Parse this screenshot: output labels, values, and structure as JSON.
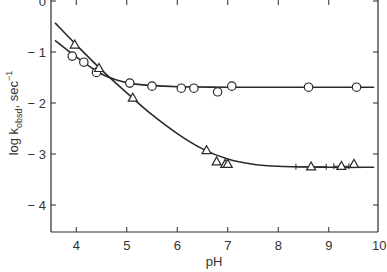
{
  "chart_data": {
    "type": "scatter",
    "title": "",
    "xlabel": "pH",
    "ylabel": "log k_obsd, sec^-1",
    "ylabel_parts": {
      "main": "log k",
      "sub": "obsd",
      "unit": ", sec",
      "sup": "−1"
    },
    "xlim": [
      3.5,
      10
    ],
    "ylim": [
      -4.55,
      0
    ],
    "x_ticks": [
      4,
      5,
      6,
      7,
      8,
      9,
      10
    ],
    "x_tick_labels": [
      "4",
      "5",
      "6",
      "7",
      "8",
      "9",
      "10"
    ],
    "y_ticks": [
      0,
      -1,
      -2,
      -3,
      -4
    ],
    "y_tick_labels": [
      "0",
      "− 1",
      "− 2",
      "− 3",
      "− 4"
    ],
    "grid": false,
    "legend": null,
    "series": [
      {
        "name": "circles",
        "marker": "circle",
        "points": [
          {
            "x": 3.92,
            "y": -1.08
          },
          {
            "x": 4.15,
            "y": -1.2
          },
          {
            "x": 4.4,
            "y": -1.4
          },
          {
            "x": 5.06,
            "y": -1.61
          },
          {
            "x": 5.5,
            "y": -1.67
          },
          {
            "x": 6.08,
            "y": -1.71
          },
          {
            "x": 6.33,
            "y": -1.71
          },
          {
            "x": 6.8,
            "y": -1.78
          },
          {
            "x": 7.08,
            "y": -1.67
          },
          {
            "x": 8.6,
            "y": -1.69
          },
          {
            "x": 9.55,
            "y": -1.69
          }
        ],
        "fit_curve": [
          [
            3.58,
            -0.77
          ],
          [
            3.9,
            -1.02
          ],
          [
            4.2,
            -1.24
          ],
          [
            4.5,
            -1.43
          ],
          [
            4.8,
            -1.55
          ],
          [
            5.1,
            -1.62
          ],
          [
            5.5,
            -1.66
          ],
          [
            6.0,
            -1.68
          ],
          [
            7.0,
            -1.69
          ],
          [
            8.0,
            -1.69
          ],
          [
            9.0,
            -1.69
          ],
          [
            9.9,
            -1.69
          ]
        ]
      },
      {
        "name": "triangles",
        "marker": "triangle",
        "points": [
          {
            "x": 3.97,
            "y": -0.86
          },
          {
            "x": 4.45,
            "y": -1.32
          },
          {
            "x": 5.12,
            "y": -1.9
          },
          {
            "x": 6.58,
            "y": -2.93
          },
          {
            "x": 6.78,
            "y": -3.15
          },
          {
            "x": 6.95,
            "y": -3.2
          },
          {
            "x": 7.0,
            "y": -3.2
          },
          {
            "x": 8.65,
            "y": -3.25,
            "error": 0.3
          },
          {
            "x": 9.25,
            "y": -3.24,
            "error": 0.15
          },
          {
            "x": 9.5,
            "y": -3.2
          }
        ],
        "fit_curve": [
          [
            3.58,
            -0.43
          ],
          [
            4.0,
            -0.86
          ],
          [
            4.5,
            -1.35
          ],
          [
            5.0,
            -1.8
          ],
          [
            5.5,
            -2.23
          ],
          [
            6.0,
            -2.6
          ],
          [
            6.5,
            -2.9
          ],
          [
            7.0,
            -3.1
          ],
          [
            7.5,
            -3.2
          ],
          [
            8.0,
            -3.24
          ],
          [
            9.0,
            -3.26
          ],
          [
            9.9,
            -3.26
          ]
        ]
      }
    ]
  }
}
